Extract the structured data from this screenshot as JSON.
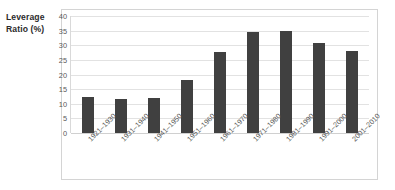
{
  "chart_data": {
    "type": "bar",
    "title": "",
    "subtitle": "",
    "xlabel": "",
    "ylabel": "Leverage Ratio (%)",
    "ylabel_lines": [
      "Leverage",
      "Ratio (%)"
    ],
    "categories": [
      "1921–1930",
      "1931–1940",
      "1941–1950",
      "1951–1960",
      "1961–1970",
      "1971–1980",
      "1981–1990",
      "1991–2000",
      "2001–2010"
    ],
    "values": [
      12.3,
      11.6,
      11.9,
      18.1,
      27.6,
      34.6,
      35.0,
      30.7,
      27.9
    ],
    "ylim": [
      0,
      40
    ],
    "ytick_step": 5,
    "yticks": [
      "40",
      "35",
      "30",
      "25",
      "20",
      "15",
      "10",
      "5",
      "0"
    ],
    "ytick_values": [
      40,
      35,
      30,
      25,
      20,
      15,
      10,
      5,
      0
    ],
    "grid": true,
    "grid_axis": "y",
    "legend": false,
    "legend_position": "none",
    "bar_color": "#404040",
    "grid_color": "#e2e2e2",
    "frame_color": "#d4d4d4",
    "tick_label_color": "#595959",
    "axis_title_color": "#2b2b2b",
    "background": "#ffffff",
    "xtick_rotation": -45
  }
}
